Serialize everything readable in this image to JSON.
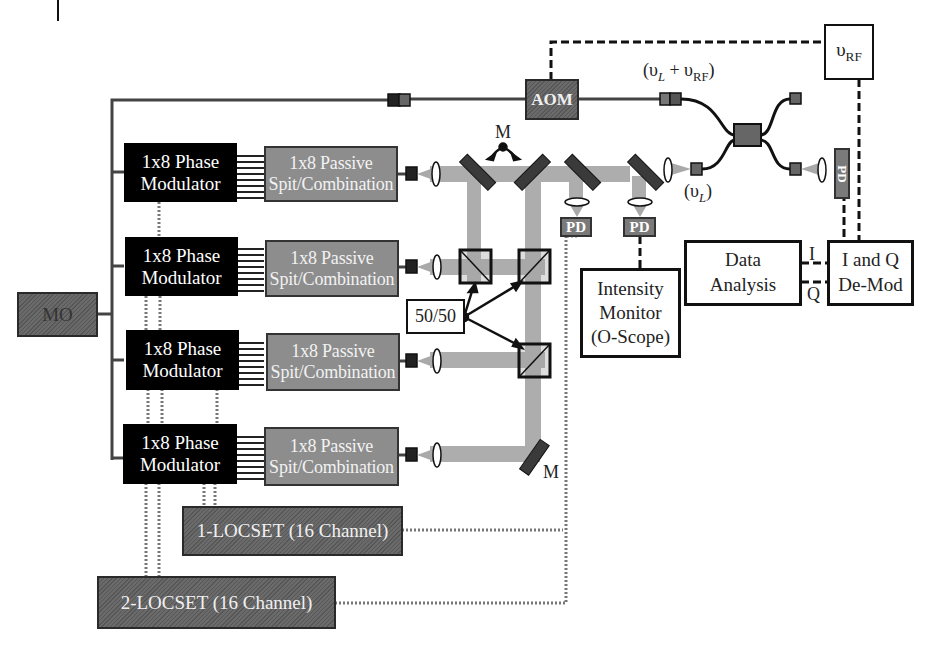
{
  "diagram": {
    "colors": {
      "modulator": "#000000",
      "passive": "#8d8d8d",
      "hatched_component": "#6a6a6a",
      "beam": "#a9a9a9",
      "line": "#2a2a2a"
    },
    "master_oscillator": {
      "label": "MO"
    },
    "aom": {
      "label": "AOM"
    },
    "rf_source": {
      "symbol": "υ",
      "subscript": "RF"
    },
    "freq_labels": {
      "shifted": {
        "open": "(υ",
        "sub1": "L",
        "plus": " + υ",
        "sub2": "RF",
        "close": ")"
      },
      "local": {
        "open": "(υ",
        "sub": "L",
        "close": ")"
      }
    },
    "channels": [
      {
        "modulator": [
          "1x8 Phase",
          "Modulator"
        ],
        "passive": [
          "1x8 Passive",
          "Spit/Combination"
        ]
      },
      {
        "modulator": [
          "1x8 Phase",
          "Modulator"
        ],
        "passive": [
          "1x8 Passive",
          "Spit/Combination"
        ]
      },
      {
        "modulator": [
          "1x8 Phase",
          "Modulator"
        ],
        "passive": [
          "1x8 Passive",
          "Spit/Combination"
        ]
      },
      {
        "modulator": [
          "1x8 Phase",
          "Modulator"
        ],
        "passive": [
          "1x8 Passive",
          "Spit/Combination"
        ]
      }
    ],
    "mirror_labels": {
      "top": "M",
      "bottom": "M"
    },
    "splitter": {
      "label": "50/50"
    },
    "photodetectors": {
      "label": "PD"
    },
    "intensity_monitor": {
      "lines": [
        "Intensity",
        "Monitor",
        "(O-Scope)"
      ]
    },
    "data_analysis": {
      "lines": [
        "Data",
        "Analysis"
      ]
    },
    "iq_demod": {
      "lines": [
        "I and Q",
        "De-Mod"
      ]
    },
    "iq_signals": {
      "i": "I",
      "q": "Q"
    },
    "locset": [
      {
        "label": "1-LOCSET (16 Channel)"
      },
      {
        "label": "2-LOCSET (16 Channel)"
      }
    ]
  }
}
